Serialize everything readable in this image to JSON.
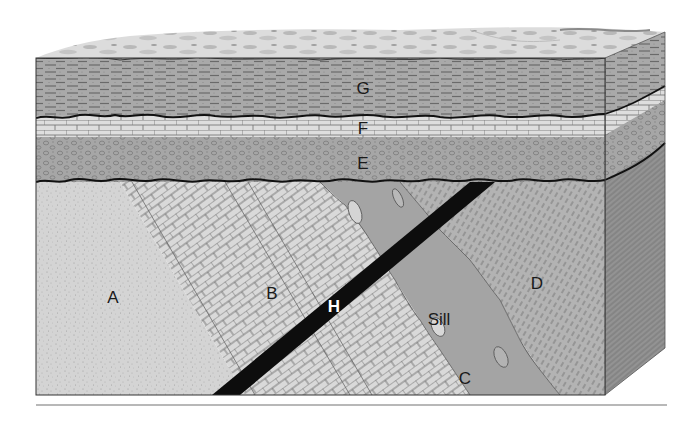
{
  "diagram": {
    "labels": {
      "G": "G",
      "F": "F",
      "E": "E",
      "A": "A",
      "B": "B",
      "C": "C",
      "D": "D",
      "H": "H",
      "sill": "Sill"
    },
    "colors": {
      "surface": "#d9d9d9",
      "layer_g": "#a9a9a9",
      "layer_f": "#dcdcdc",
      "layer_e": "#a6a6a6",
      "unit_a": "#d4d4d4",
      "unit_b": "#d8d8d8",
      "unit_c_sill": "#a4a4a4",
      "unit_d": "#b2b2b2",
      "dike_h": "#0d0d0d",
      "side_face": "#8e8e8e",
      "separator": "#b8b8b8"
    }
  }
}
